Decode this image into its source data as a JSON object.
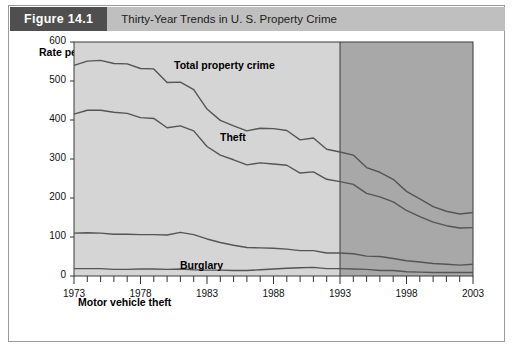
{
  "figure": {
    "number_label": "Figure 14.1",
    "title": "Thirty-Year Trends in U. S. Property Crime"
  },
  "colors": {
    "header_number_bg": "#4f4f4f",
    "header_title_bg": "#bfbfbf",
    "plot_bg_light": "#d5d5d5",
    "plot_bg_shaded": "#a8a8a8",
    "line": "#555555",
    "axis": "#333333",
    "frame": "#9a9a9a"
  },
  "chart_data": {
    "type": "line",
    "title": "Thirty-Year Trends in U. S. Property Crime",
    "xlabel": "",
    "ylabel": "Rate per 1,000 households",
    "xlim": [
      1973,
      2003
    ],
    "ylim": [
      0,
      600
    ],
    "grid": false,
    "legend": "inline-labels",
    "y_ticks": [
      0,
      100,
      200,
      300,
      400,
      500,
      600
    ],
    "y_tick_labels": [
      "0",
      "100",
      "200",
      "300",
      "400",
      "500",
      "600"
    ],
    "x_ticks": [
      1973,
      1978,
      1983,
      1988,
      1993,
      1998,
      2003
    ],
    "x_tick_labels": [
      "1973",
      "1978",
      "1983",
      "1988",
      "1993",
      "1998",
      "2003"
    ],
    "x_minor_tick_interval": 1,
    "shaded_region": {
      "from": 1993,
      "to": 2003,
      "note": "darker shaded band"
    },
    "x": [
      1973,
      1974,
      1975,
      1976,
      1977,
      1978,
      1979,
      1980,
      1981,
      1982,
      1983,
      1984,
      1985,
      1986,
      1987,
      1988,
      1989,
      1990,
      1991,
      1992,
      1993,
      1994,
      1995,
      1996,
      1997,
      1998,
      1999,
      2000,
      2001,
      2002,
      2003
    ],
    "series": [
      {
        "name": "Total property crime",
        "values": [
          540,
          551,
          553,
          545,
          544,
          532,
          531,
          496,
          497,
          478,
          428,
          399,
          385,
          372,
          379,
          378,
          373,
          349,
          354,
          325,
          318,
          310,
          278,
          266,
          248,
          217,
          198,
          178,
          166,
          159,
          163
        ]
      },
      {
        "name": "Theft",
        "values": [
          415,
          425,
          425,
          420,
          417,
          406,
          404,
          380,
          385,
          372,
          332,
          310,
          298,
          285,
          290,
          287,
          284,
          264,
          267,
          248,
          242,
          235,
          212,
          203,
          190,
          168,
          152,
          138,
          129,
          123,
          124
        ]
      },
      {
        "name": "Burglary",
        "values": [
          110,
          111,
          110,
          107,
          107,
          106,
          106,
          105,
          112,
          106,
          95,
          86,
          79,
          73,
          72,
          71,
          69,
          65,
          65,
          59,
          59,
          57,
          51,
          50,
          45,
          39,
          36,
          32,
          30,
          28,
          30
        ]
      },
      {
        "name": "Motor vehicle theft",
        "values": [
          19,
          19,
          19,
          17,
          17,
          18,
          18,
          17,
          18,
          16,
          15,
          15,
          14,
          14,
          16,
          18,
          20,
          21,
          22,
          19,
          19,
          18,
          17,
          14,
          14,
          11,
          10,
          9,
          9,
          9,
          9
        ]
      }
    ],
    "series_labels": [
      {
        "text": "Total property crime",
        "x_px": 164,
        "y_px": 28
      },
      {
        "text": "Theft",
        "x_px": 210,
        "y_px": 100
      },
      {
        "text": "Burglary",
        "x_px": 170,
        "y_px": 228
      },
      {
        "text": "Motor vehicle theft",
        "x_px": 68,
        "y_px": 265
      }
    ]
  }
}
